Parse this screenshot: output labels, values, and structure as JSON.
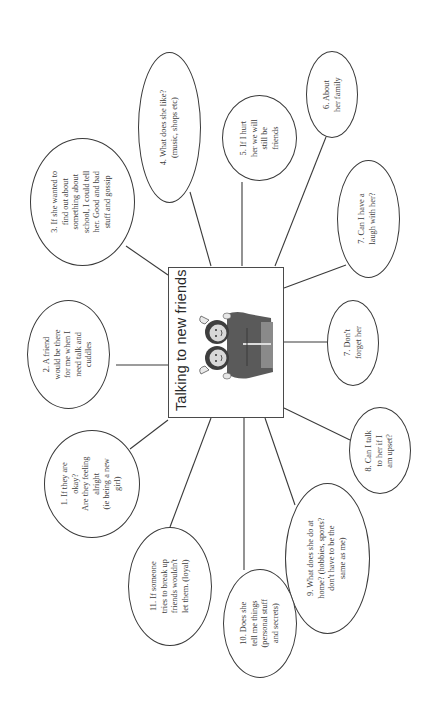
{
  "diagram": {
    "title": "Talking to new friends",
    "center_image": "two-friends-illustration",
    "colors": {
      "line": "#3a3a3a",
      "text": "#3c3c3c",
      "background": "#ffffff",
      "figure": "#555555"
    },
    "nodes": [
      {
        "id": "n1",
        "label": "1. If they are\nokay?\nAre they feeling\nalright\n(ie being a new\ngirl)"
      },
      {
        "id": "n2",
        "label": "2. A friend\nwould be there\nfor me when I\nneed talk and\ncuddles"
      },
      {
        "id": "n3",
        "label": "3. If she wanted to\nfind out about\nsomething about\nschool, I could tell\nher. Good and bad\nstuff and gossip"
      },
      {
        "id": "n4",
        "label": "4. What does she like?\n(music, shops etc)"
      },
      {
        "id": "n5",
        "label": "5.  If I hurt\nher  we will\nstill be\nfriends"
      },
      {
        "id": "n6",
        "label": "6. About\nher family"
      },
      {
        "id": "n7a",
        "label": "7. Can I have a\nlaugh with her?"
      },
      {
        "id": "n7b",
        "label": "7. Don't\nforget her"
      },
      {
        "id": "n8",
        "label": "8. Can I talk\nto her if I\nam upset?"
      },
      {
        "id": "n9",
        "label": "9. What does she do at\nhome? (hobbies, sports?\ndon't have to be the\nsame as me)"
      },
      {
        "id": "n10",
        "label": "10. Does she\ntell me things\n(personal stuff\nand secrets)"
      },
      {
        "id": "n11",
        "label": "11. If someone\ntries to break up\nfriends wouldn't\nlet  them. (loyal)"
      }
    ]
  }
}
